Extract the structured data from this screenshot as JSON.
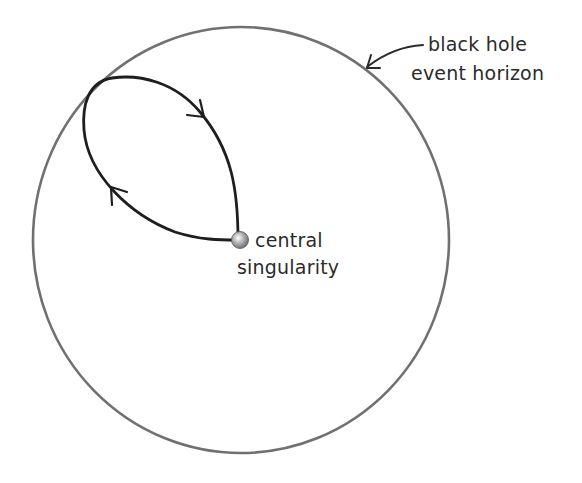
{
  "diagram": {
    "title": "",
    "labels": {
      "event_horizon_line1": "black hole",
      "event_horizon_line2": "event horizon",
      "singularity_line1": "central",
      "singularity_line2": "singularity"
    },
    "elements": [
      {
        "id": "event-horizon",
        "shape": "ellipse",
        "description": "black hole event horizon"
      },
      {
        "id": "singularity",
        "shape": "sphere",
        "description": "central singularity"
      },
      {
        "id": "orbit-loop",
        "shape": "closed loop path with two direction arrows",
        "direction": "clockwise"
      }
    ],
    "colors": {
      "horizon_stroke": "#6e6e6e",
      "loop_stroke": "#1e1e1e",
      "text": "#2b2b2b",
      "singularity_fill": "#9a9a9a"
    }
  }
}
